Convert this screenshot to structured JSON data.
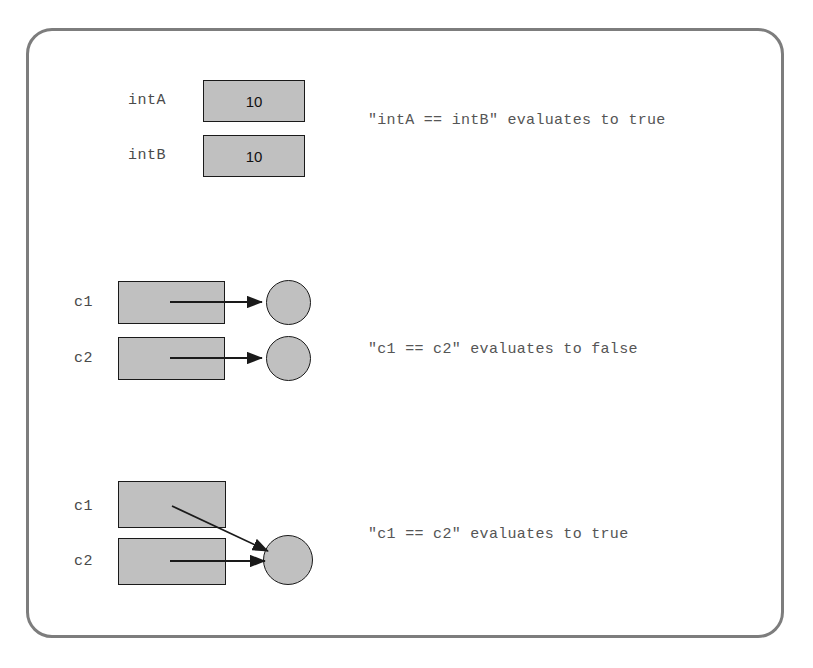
{
  "figure": {
    "frame": {
      "border_color": "#7d7d7d",
      "background": "#ffffff"
    },
    "style": {
      "shape_fill": "#c0c0c0",
      "shape_stroke": "#1a1a1a",
      "label_color": "#4a4a4a",
      "caption_color": "#555555",
      "arrow_color": "#1a1a1a"
    }
  },
  "sections": [
    {
      "id": "primitives",
      "caption": "\"intA == intB\" evaluates to true",
      "variables": [
        {
          "label": "intA",
          "value": "10"
        },
        {
          "label": "intB",
          "value": "10"
        }
      ]
    },
    {
      "id": "distinct-references",
      "caption": "\"c1 == c2\" evaluates to false",
      "variables": [
        {
          "label": "c1",
          "value": ""
        },
        {
          "label": "c2",
          "value": ""
        }
      ],
      "objects": 2
    },
    {
      "id": "aliased-references",
      "caption": "\"c1 == c2\" evaluates to true",
      "variables": [
        {
          "label": "c1",
          "value": ""
        },
        {
          "label": "c2",
          "value": ""
        }
      ],
      "objects": 1
    }
  ]
}
